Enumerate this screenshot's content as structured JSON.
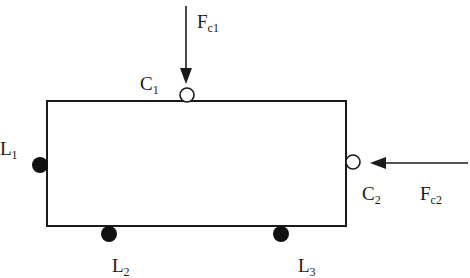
{
  "diagram": {
    "type": "free-body diagram of rectangular body with contact and load points",
    "colors": {
      "stroke": "#1a1a1a",
      "fill_solid": "#111111",
      "fill_open": "#ffffff"
    },
    "body": {
      "shape": "rectangle",
      "x": 47,
      "y": 101,
      "width": 299,
      "height": 125
    },
    "forces": [
      {
        "id": "Fc1",
        "label_main": "F",
        "label_sub": "c1",
        "direction": "down",
        "acts_on": "C1"
      },
      {
        "id": "Fc2",
        "label_main": "F",
        "label_sub": "c2",
        "direction": "left",
        "acts_on": "C2"
      }
    ],
    "contact_points": [
      {
        "id": "C1",
        "label_main": "C",
        "label_sub": "1",
        "style": "open-circle",
        "edge": "top"
      },
      {
        "id": "C2",
        "label_main": "C",
        "label_sub": "2",
        "style": "open-circle",
        "edge": "right"
      }
    ],
    "locator_points": [
      {
        "id": "L1",
        "label_main": "L",
        "label_sub": "1",
        "style": "filled-circle",
        "edge": "left"
      },
      {
        "id": "L2",
        "label_main": "L",
        "label_sub": "2",
        "style": "filled-circle",
        "edge": "bottom"
      },
      {
        "id": "L3",
        "label_main": "L",
        "label_sub": "3",
        "style": "filled-circle",
        "edge": "bottom"
      }
    ]
  }
}
